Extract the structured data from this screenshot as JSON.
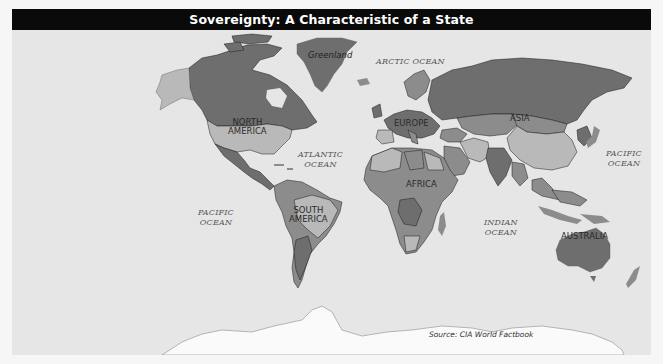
{
  "title": "Sovereignty: A Characteristic of a State",
  "colors": {
    "title_bg": "#0a0a0a",
    "title_text": "#ffffff",
    "ocean": "#e6e6e6",
    "land_dark": "#6e6e6e",
    "land_mid": "#8c8c8c",
    "land_light": "#b9b9b9",
    "antarctica": "#fafafa",
    "border": "#1a1a1a"
  },
  "map": {
    "continent_labels": [
      {
        "id": "north-america",
        "line1": "NORTH",
        "line2": "AMERICA"
      },
      {
        "id": "south-america",
        "line1": "SOUTH",
        "line2": "AMERICA"
      },
      {
        "id": "europe",
        "text": "EUROPE"
      },
      {
        "id": "asia",
        "text": "ASIA"
      },
      {
        "id": "africa",
        "text": "AFRICA"
      },
      {
        "id": "australia",
        "text": "AUSTRALIA"
      }
    ],
    "region_labels": [
      {
        "id": "greenland",
        "text": "Greenland"
      }
    ],
    "ocean_labels": [
      {
        "id": "arctic",
        "line1": "ARCTIC OCEAN"
      },
      {
        "id": "atlantic",
        "line1": "ATLANTIC",
        "line2": "OCEAN"
      },
      {
        "id": "pacific-west",
        "line1": "PACIFIC",
        "line2": "OCEAN"
      },
      {
        "id": "pacific-east",
        "line1": "PACIFIC",
        "line2": "OCEAN"
      },
      {
        "id": "indian",
        "line1": "INDIAN",
        "line2": "OCEAN"
      }
    ],
    "source": "Source: CIA World Factbook"
  }
}
